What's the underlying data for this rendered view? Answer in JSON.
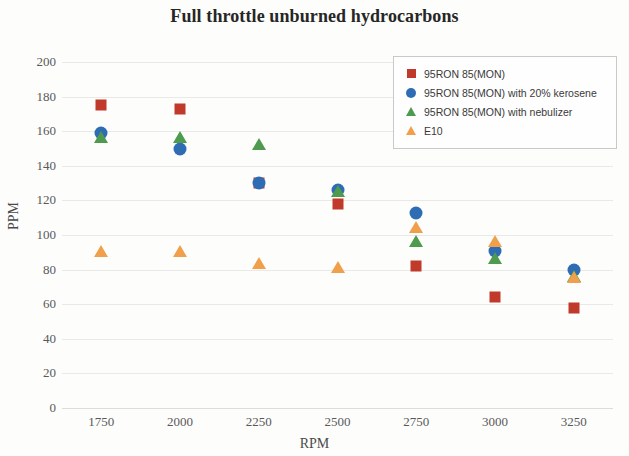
{
  "chart_data": {
    "type": "scatter",
    "title": "Full throttle unburned hydrocarbons",
    "xlabel": "RPM",
    "ylabel": "PPM",
    "categories": [
      1750,
      2000,
      2250,
      2500,
      2750,
      3000,
      3250
    ],
    "xticklabels": [
      "1750",
      "2000",
      "2250",
      "2500",
      "2750",
      "3000",
      "3250"
    ],
    "yticklabels": [
      "200",
      "180",
      "160",
      "140",
      "120",
      "100",
      "80",
      "60",
      "40",
      "20",
      "0"
    ],
    "ylim": [
      0,
      200
    ],
    "ytick_step": 20,
    "grid": true,
    "legend_position": "top-right",
    "series": [
      {
        "name": "95RON 85(MON)",
        "marker": "square",
        "color": "#C0392B",
        "values": [
          175,
          173,
          130,
          118,
          82,
          64,
          58
        ]
      },
      {
        "name": "95RON 85(MON) with 20% kerosene",
        "marker": "circle",
        "color": "#2E6DB4",
        "values": [
          159,
          150,
          130,
          126,
          113,
          91,
          80
        ]
      },
      {
        "name": "95RON 85(MON) with nebulizer",
        "marker": "triangle",
        "color": "#4E9A4E",
        "values": [
          156,
          156,
          152,
          125,
          96,
          86,
          76
        ]
      },
      {
        "name": "E10",
        "marker": "triangle",
        "color": "#F0A04B",
        "values": [
          90,
          90,
          83,
          81,
          104,
          96,
          75
        ]
      }
    ]
  }
}
